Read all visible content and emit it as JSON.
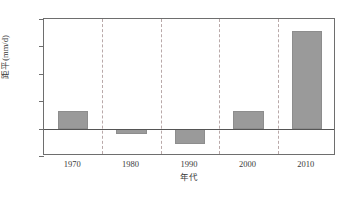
{
  "chart_data": {
    "type": "bar",
    "title": "",
    "xlabel": "年代",
    "ylabel": "距平(mm/d)",
    "categories": [
      "1970",
      "1980",
      "1990",
      "2000",
      "2010"
    ],
    "values": [
      0.063,
      -0.02,
      -0.058,
      0.064,
      0.358
    ],
    "ylim": [
      -0.1,
      0.4
    ],
    "yticks": [
      "0.40",
      "0.30",
      "0.20",
      "0.10",
      "0.00",
      "-0.10"
    ],
    "ytick_values": [
      0.4,
      0.3,
      0.2,
      0.1,
      0.0,
      -0.1
    ],
    "grid": "vertical-dashed",
    "legend": "none",
    "zero_line": 0.0,
    "bar_color": "#9a9a9a",
    "axis_color": "#6e6e6e",
    "grid_color": "#b9a9a9"
  }
}
